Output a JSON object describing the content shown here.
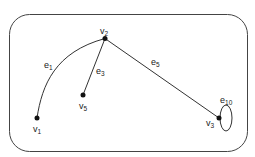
{
  "diagram": {
    "type": "graph",
    "colors": {
      "stroke": "#333333",
      "vertex": "#111111",
      "background": "#ffffff"
    },
    "vertices": [
      {
        "id": "v1",
        "base": "v",
        "sub": "1"
      },
      {
        "id": "v2",
        "base": "v",
        "sub": "2"
      },
      {
        "id": "v3",
        "base": "v",
        "sub": "3"
      },
      {
        "id": "v5",
        "base": "v",
        "sub": "5"
      }
    ],
    "edges": [
      {
        "id": "e1",
        "base": "e",
        "sub": "1",
        "from": "v1",
        "to": "v2",
        "shape": "curve"
      },
      {
        "id": "e3",
        "base": "e",
        "sub": "3",
        "from": "v5",
        "to": "v2",
        "shape": "line"
      },
      {
        "id": "e5",
        "base": "e",
        "sub": "5",
        "from": "v2",
        "to": "v3",
        "shape": "line"
      },
      {
        "id": "e10",
        "base": "e",
        "sub": "10",
        "from": "v3",
        "to": "v3",
        "shape": "loop"
      }
    ]
  }
}
